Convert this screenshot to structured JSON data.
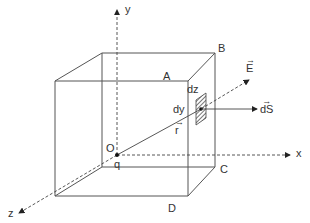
{
  "figure": {
    "axes": {
      "x": "x",
      "y": "y",
      "z": "z"
    },
    "vertices": {
      "A": "A",
      "B": "B",
      "C": "C",
      "D": "D"
    },
    "origin": {
      "label": "O",
      "charge": "q"
    },
    "element": {
      "dz": "dz",
      "dy": "dy"
    },
    "vectors": {
      "E": "E",
      "dS": "dS",
      "r": "r",
      "arrow": "→"
    },
    "colors": {
      "line": "#555555",
      "text": "#333333",
      "hatch": "#666666"
    }
  }
}
